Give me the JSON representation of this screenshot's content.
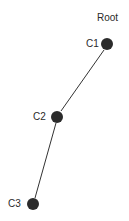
{
  "diagram": {
    "type": "tree",
    "colors": {
      "node": "#2b2b2b",
      "edge": "#333333",
      "text": "#2a2a2a",
      "background": "#ffffff"
    },
    "root_label": "Root",
    "nodes": [
      {
        "id": "C1",
        "label": "C1",
        "x": 107,
        "y": 44
      },
      {
        "id": "C2",
        "label": "C2",
        "x": 57,
        "y": 117
      },
      {
        "id": "C3",
        "label": "C3",
        "x": 33,
        "y": 204
      }
    ],
    "edges": [
      {
        "from": "C1",
        "to": "C2"
      },
      {
        "from": "C2",
        "to": "C3"
      }
    ]
  }
}
